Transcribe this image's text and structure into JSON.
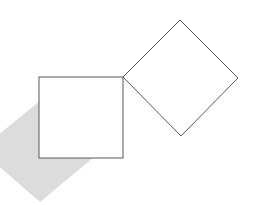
{
  "canvas": {
    "width": 262,
    "height": 205,
    "background_color": "#ffffff",
    "title": "Two squares with shadow"
  },
  "style": {
    "stroke_color": "#595959",
    "stroke_width": 1,
    "shadow_fill_color": "#dcdcdc",
    "outline_fill_color": "#ffffff"
  },
  "shapes": {
    "shadow_diamond": {
      "label": "gray shadow diamond",
      "fill": "#dcdcdc",
      "stroke": "none",
      "points": "41,100 100,152 40,202 -20,150"
    },
    "upright_square": {
      "label": "upright square outline",
      "fill": "#ffffff",
      "stroke": "#595959",
      "x": 39,
      "y": 77,
      "width": 84,
      "height": 81
    },
    "rotated_square": {
      "label": "rotated square outline",
      "fill": "#ffffff",
      "stroke": "#595959",
      "points": "123,77 180,20 238,78 181,136"
    }
  }
}
